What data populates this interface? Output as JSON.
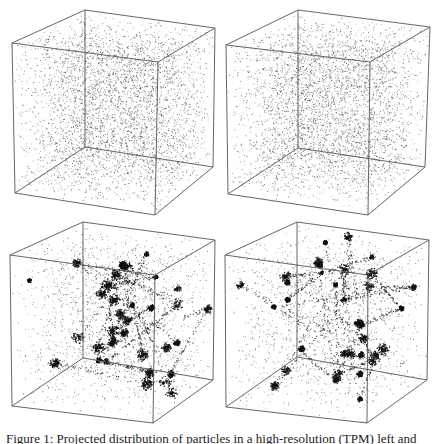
{
  "figure": {
    "caption": "Figure 1: Projected distribution of particles in a high-resolution (TPM) left and",
    "panels": [
      {
        "id": "top-left",
        "description": "initial uniform particle distribution in cube",
        "state": "initial",
        "corners": {
          "btl": [
            85,
            10
          ],
          "btr": [
            215,
            28
          ],
          "bbl": [
            85,
            147
          ],
          "bbr": [
            213,
            167
          ],
          "ftl": [
            12,
            43
          ],
          "ftr": [
            158,
            62
          ],
          "fbl": [
            15,
            193
          ],
          "fbr": [
            155,
            215
          ]
        }
      },
      {
        "id": "top-right",
        "description": "initial uniform particle distribution in cube",
        "state": "initial",
        "corners": {
          "btl": [
            298,
            10
          ],
          "btr": [
            430,
            27
          ],
          "bbl": [
            298,
            148
          ],
          "bbr": [
            425,
            167
          ],
          "ftl": [
            226,
            45
          ],
          "ftr": [
            370,
            62
          ],
          "fbl": [
            228,
            194
          ],
          "fbr": [
            368,
            215
          ]
        }
      },
      {
        "id": "bottom-left",
        "description": "evolved clustered particle distribution (TPM)",
        "state": "evolved",
        "corners": {
          "btl": [
            83,
            222
          ],
          "btr": [
            215,
            240
          ],
          "bbl": [
            83,
            358
          ],
          "bbr": [
            213,
            380
          ],
          "ftl": [
            10,
            255
          ],
          "ftr": [
            155,
            275
          ],
          "fbl": [
            12,
            406
          ],
          "fbr": [
            153,
            423
          ]
        }
      },
      {
        "id": "bottom-right",
        "description": "evolved clustered particle distribution",
        "state": "evolved",
        "corners": {
          "btl": [
            297,
            222
          ],
          "btr": [
            429,
            240
          ],
          "bbl": [
            297,
            357
          ],
          "bbr": [
            427,
            380
          ],
          "ftl": [
            225,
            255
          ],
          "ftr": [
            368,
            275
          ],
          "fbl": [
            226,
            407
          ],
          "fbr": [
            367,
            423
          ]
        }
      }
    ],
    "colors": {
      "edge": "#555555",
      "particle": "#111111",
      "background": "#ffffff"
    }
  }
}
